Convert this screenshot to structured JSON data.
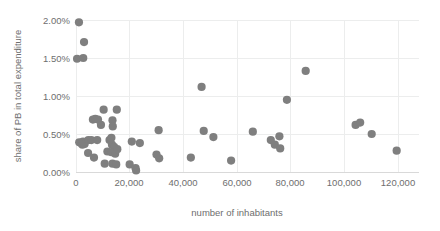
{
  "chart_data": {
    "type": "scatter",
    "title": "",
    "xlabel": "number of inhabitants",
    "ylabel": "share of PB in total expenditure",
    "xlim": [
      0,
      130000
    ],
    "ylim": [
      0,
      0.021
    ],
    "xticks": [
      0,
      20000,
      40000,
      60000,
      80000,
      100000,
      120000
    ],
    "xtick_labels": [
      "0",
      "20,000",
      "40,000",
      "60,000",
      "80,000",
      "100,000",
      "120,000"
    ],
    "yticks": [
      0,
      0.005,
      0.01,
      0.015,
      0.02
    ],
    "ytick_labels": [
      "0.00%",
      "0.50%",
      "1.00%",
      "1.50%",
      "2.00%"
    ],
    "grid": true,
    "legend": false,
    "marker_color": "#7f7f7f",
    "marker_size": 4.6,
    "series": [
      {
        "name": "municipalities",
        "points": [
          {
            "x": 1100,
            "y": 0.0197
          },
          {
            "x": 3000,
            "y": 0.0171
          },
          {
            "x": 400,
            "y": 0.0149
          },
          {
            "x": 2700,
            "y": 0.015
          },
          {
            "x": 46800,
            "y": 0.0112
          },
          {
            "x": 85600,
            "y": 0.0133
          },
          {
            "x": 78600,
            "y": 0.0095
          },
          {
            "x": 10300,
            "y": 0.0082
          },
          {
            "x": 15200,
            "y": 0.0082
          },
          {
            "x": 6300,
            "y": 0.0069
          },
          {
            "x": 7200,
            "y": 0.007
          },
          {
            "x": 8200,
            "y": 0.0069
          },
          {
            "x": 9300,
            "y": 0.0062
          },
          {
            "x": 13600,
            "y": 0.0068
          },
          {
            "x": 13700,
            "y": 0.006
          },
          {
            "x": 30800,
            "y": 0.0055
          },
          {
            "x": 47600,
            "y": 0.0054
          },
          {
            "x": 65900,
            "y": 0.0053
          },
          {
            "x": 104200,
            "y": 0.0062
          },
          {
            "x": 105900,
            "y": 0.0065
          },
          {
            "x": 110200,
            "y": 0.005
          },
          {
            "x": 119500,
            "y": 0.0028
          },
          {
            "x": 1200,
            "y": 0.0039
          },
          {
            "x": 1900,
            "y": 0.0038
          },
          {
            "x": 2400,
            "y": 0.0036
          },
          {
            "x": 2600,
            "y": 0.004
          },
          {
            "x": 3200,
            "y": 0.0037
          },
          {
            "x": 4600,
            "y": 0.0042
          },
          {
            "x": 5700,
            "y": 0.0042
          },
          {
            "x": 7900,
            "y": 0.0042
          },
          {
            "x": 12500,
            "y": 0.0042
          },
          {
            "x": 13200,
            "y": 0.0045
          },
          {
            "x": 13400,
            "y": 0.0036
          },
          {
            "x": 14200,
            "y": 0.0033
          },
          {
            "x": 20800,
            "y": 0.004
          },
          {
            "x": 23800,
            "y": 0.0038
          },
          {
            "x": 51200,
            "y": 0.0046
          },
          {
            "x": 72600,
            "y": 0.0042
          },
          {
            "x": 74100,
            "y": 0.0036
          },
          {
            "x": 75800,
            "y": 0.0047
          },
          {
            "x": 76100,
            "y": 0.0031
          },
          {
            "x": 4500,
            "y": 0.0025
          },
          {
            "x": 6700,
            "y": 0.0019
          },
          {
            "x": 11700,
            "y": 0.0027
          },
          {
            "x": 13200,
            "y": 0.0026
          },
          {
            "x": 14600,
            "y": 0.0024
          },
          {
            "x": 15400,
            "y": 0.003
          },
          {
            "x": 10700,
            "y": 0.0011
          },
          {
            "x": 13600,
            "y": 0.0011
          },
          {
            "x": 15000,
            "y": 0.001
          },
          {
            "x": 20000,
            "y": 0.001
          },
          {
            "x": 22200,
            "y": 0.0005
          },
          {
            "x": 22400,
            "y": 0.0002
          },
          {
            "x": 31000,
            "y": 0.0018
          },
          {
            "x": 42800,
            "y": 0.0019
          },
          {
            "x": 57800,
            "y": 0.0015
          },
          {
            "x": 30000,
            "y": 0.0023
          }
        ]
      }
    ]
  }
}
